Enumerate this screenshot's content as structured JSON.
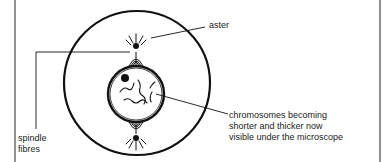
{
  "diagram": {
    "type": "biology-cell-division-prophase",
    "labels": {
      "aster": "aster",
      "chromosomes": [
        "chromosomes becoming",
        "shorter and thicker now",
        "visible under the microscope"
      ],
      "spindle": [
        "spindle",
        "fibres"
      ]
    },
    "colors": {
      "ink": "#111111",
      "background": "#ffffff"
    }
  }
}
